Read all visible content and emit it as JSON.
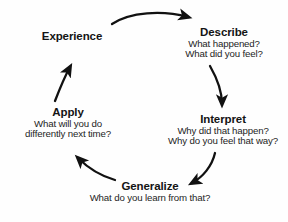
{
  "diagram": {
    "background_color": "#fefefe",
    "text_color": "#1a1a1a",
    "arrow_color": "#111111",
    "nodes": [
      {
        "id": "experience",
        "title": "Experience",
        "lines": []
      },
      {
        "id": "describe",
        "title": "Describe",
        "lines": [
          "What happened?",
          "What did you feel?"
        ]
      },
      {
        "id": "interpret",
        "title": "Interpret",
        "lines": [
          "Why did that happen?",
          "Why do you feel that way?"
        ]
      },
      {
        "id": "generalize",
        "title": "Generalize",
        "lines": [
          "What do you learn from that?"
        ]
      },
      {
        "id": "apply",
        "title": "Apply",
        "lines": [
          "What will you do",
          "differently next time?"
        ]
      }
    ],
    "arrows": [
      {
        "id": "experience-to-describe",
        "from": "experience",
        "to": "describe"
      },
      {
        "id": "describe-to-interpret",
        "from": "describe",
        "to": "interpret"
      },
      {
        "id": "interpret-to-generalize",
        "from": "interpret",
        "to": "generalize"
      },
      {
        "id": "generalize-to-apply",
        "from": "generalize",
        "to": "apply"
      },
      {
        "id": "apply-to-experience",
        "from": "apply",
        "to": "experience"
      }
    ]
  }
}
